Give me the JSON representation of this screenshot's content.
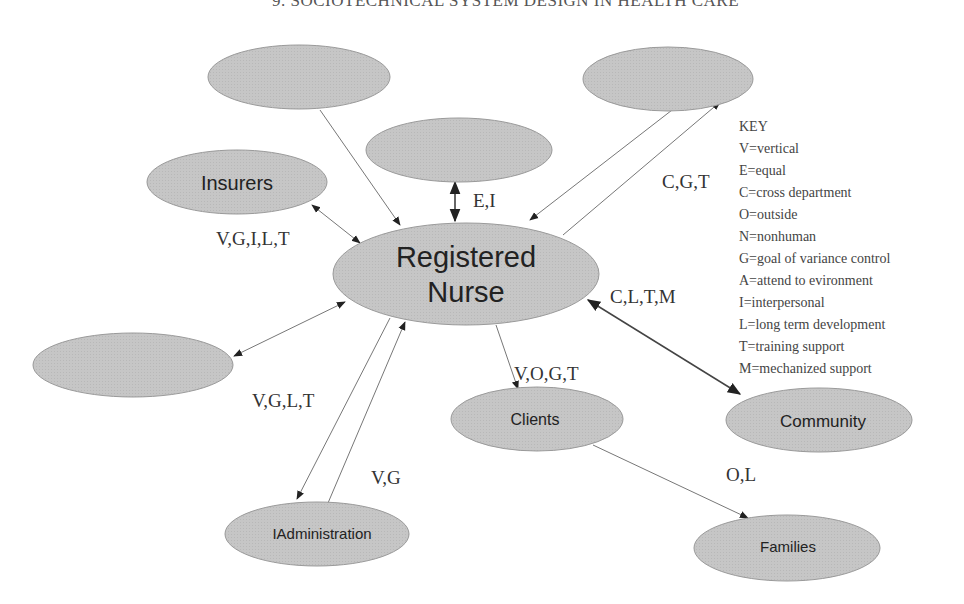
{
  "header": {
    "title": "9.    SOCIOTECHNICAL SYSTEM DESIGN IN HEALTH CARE"
  },
  "nodes": {
    "center": {
      "line1": "Registered",
      "line2": "Nurse"
    },
    "insurers": "Insurers",
    "clients": "Clients",
    "community": "Community",
    "administration": "IAdministration",
    "families": "Families",
    "blank_top_left": "",
    "blank_top_center": "",
    "blank_top_right": "",
    "blank_left": ""
  },
  "edges": {
    "top_center": "E,I",
    "top_right": "C,G,T",
    "insurers": "V,G,I,L,T",
    "community": "C,L,T,M",
    "clients": "V,O,G,T",
    "administration_out": "V,G,L,T",
    "administration_in": "V,G",
    "families": "O,L"
  },
  "key": {
    "title": "KEY",
    "items": [
      "V=vertical",
      "E=equal",
      "C=cross department",
      "O=outside",
      "N=nonhuman",
      "G=goal of variance control",
      "A=attend to evironment",
      "I=interpersonal",
      "L=long term development",
      "T=training support",
      "M=mechanized support"
    ]
  },
  "colors": {
    "node_fill": "#c4c4c4",
    "node_stroke": "#9a9a9a",
    "line": "#777777"
  }
}
